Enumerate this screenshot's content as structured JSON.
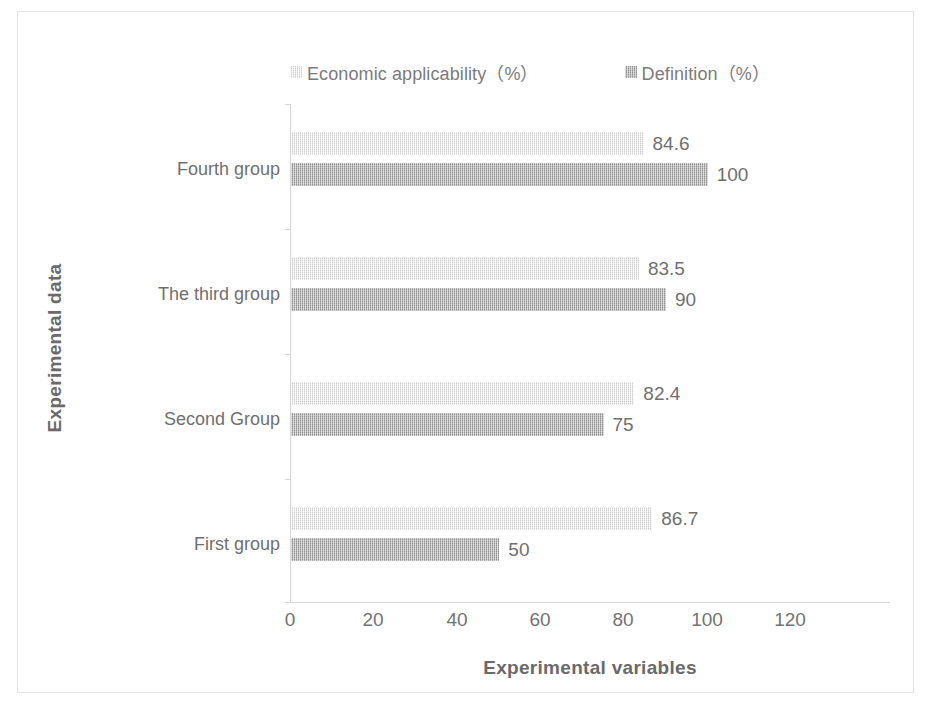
{
  "chart_data": {
    "type": "bar",
    "orientation": "horizontal",
    "title": "",
    "xlabel": "Experimental variables",
    "ylabel": "Experimental data",
    "categories": [
      "First group",
      "Second Group",
      "The third group",
      "Fourth group"
    ],
    "categories_top_to_bottom": [
      "Fourth group",
      "The third group",
      "Second Group",
      "First group"
    ],
    "series": [
      {
        "name": "Economic applicability（%）",
        "color": "#cfcfcf",
        "values": [
          86.7,
          82.4,
          83.5,
          84.6
        ],
        "labels": [
          "86.7",
          "82.4",
          "83.5",
          "84.6"
        ]
      },
      {
        "name": "Definition（%）",
        "color": "#8f8f8f",
        "values": [
          50,
          75,
          90,
          100
        ],
        "labels": [
          "50",
          "75",
          "90",
          "100"
        ]
      }
    ],
    "xlim": [
      0,
      120
    ],
    "xticks": [
      0,
      20,
      40,
      60,
      80,
      100,
      120
    ],
    "xtick_labels": [
      "0",
      "20",
      "40",
      "60",
      "80",
      "100",
      "120"
    ],
    "grid": false,
    "legend_position": "top"
  },
  "legend": {
    "entries": [
      {
        "label": "Economic applicability（%）",
        "swatch": "legend-swatch-light"
      },
      {
        "label": "Definition（%）",
        "swatch": "legend-swatch-dark"
      }
    ]
  },
  "axes": {
    "x_title": "Experimental variables",
    "y_title": "Experimental data"
  }
}
